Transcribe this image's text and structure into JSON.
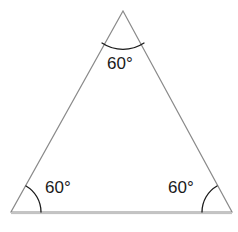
{
  "figure": {
    "shape": "triangle",
    "stroke_color": "#8a8a8a",
    "label_color": "#1a1a1a",
    "background_color": "#ffffff",
    "vertices": {
      "apex": {
        "x": 123,
        "y": 11
      },
      "bottom_left": {
        "x": 11,
        "y": 212
      },
      "bottom_right": {
        "x": 232,
        "y": 212
      }
    },
    "baseline": {
      "y": 213,
      "x_start": 11,
      "x_end": 232
    },
    "angles": [
      {
        "id": "apex",
        "label": "60°",
        "value": 60,
        "unit": "degrees",
        "arc_radius": 38
      },
      {
        "id": "bottom-left",
        "label": "60°",
        "value": 60,
        "unit": "degrees",
        "arc_radius": 30
      },
      {
        "id": "bottom-right",
        "label": "60°",
        "value": 60,
        "unit": "degrees",
        "arc_radius": 30
      }
    ]
  }
}
